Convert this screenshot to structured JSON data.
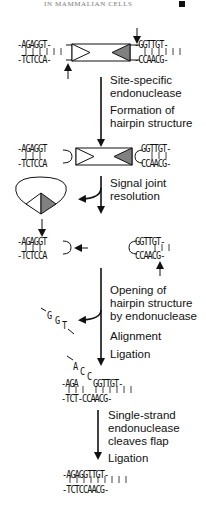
{
  "header": {
    "running_title": "IN MAMMALIAN CELLS",
    "marker": "black-square"
  },
  "steps": [
    {
      "labels": [
        "Site-specific",
        "endonuclease",
        "Formation of",
        "hairpin structure"
      ]
    },
    {
      "labels": [
        "Signal joint",
        "resolution"
      ]
    },
    {
      "labels": [
        "Opening of",
        "hairpin structure",
        "by endonuclease",
        "Alignment",
        "Ligation"
      ]
    },
    {
      "labels": [
        "Single-strand",
        "endonuclease",
        "cleaves flap",
        "Ligation"
      ]
    }
  ],
  "sequences": {
    "row1": {
      "left_top": "-AGAGGT-",
      "left_bottom": "-TCTCCA-",
      "right_top": "-GGTTGT-",
      "right_bottom": "-CCAACG-"
    },
    "row2": {
      "left_top": "-AGAGGT",
      "left_bottom": "-TCTCCA",
      "right_top": "GGTTGT-",
      "right_bottom": "CCAACG-"
    },
    "row3": {
      "left_top": "-AGAGGT",
      "left_bottom": "-TCTCCA",
      "right_top": "GGTTGT-",
      "right_bottom": "CCAACG-"
    },
    "flap_ggt": [
      "G",
      "G",
      "T"
    ],
    "flap_acc": [
      "A",
      "C",
      "C"
    ],
    "row4": {
      "top_left": "-AGA",
      "top_right": "GGTTGT-",
      "bottom": "-TCT-CCAACG-"
    },
    "final": {
      "top": "-AGAGGTTGT-",
      "bottom": "-TCTCCAACG-"
    }
  },
  "colors": {
    "signal_dark": "#808080",
    "line": "#111111",
    "header": "#777777"
  }
}
